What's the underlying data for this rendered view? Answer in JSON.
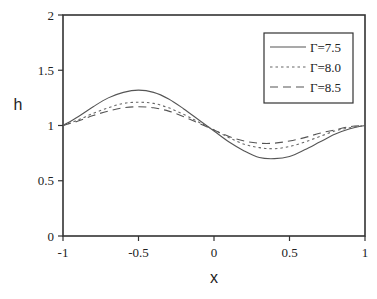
{
  "chart_data": {
    "type": "line",
    "title": "",
    "xlabel": "x",
    "ylabel": "h",
    "xlim": [
      -1,
      1
    ],
    "ylim": [
      0,
      2
    ],
    "xticks": [
      -1,
      -0.5,
      0,
      0.5,
      1
    ],
    "xtick_labels": [
      "-1",
      "-0.5",
      "0",
      "0.5",
      "1"
    ],
    "yticks": [
      0,
      0.5,
      1,
      1.5,
      2
    ],
    "ytick_labels": [
      "0",
      "0.5",
      "1",
      "1.5",
      "2"
    ],
    "grid": false,
    "legend_position": "top-right",
    "series": [
      {
        "name": "Γ=7.5",
        "style": "solid",
        "x": [
          -1,
          -0.9,
          -0.8,
          -0.7,
          -0.6,
          -0.5,
          -0.4,
          -0.3,
          -0.2,
          -0.1,
          0,
          0.1,
          0.2,
          0.3,
          0.4,
          0.5,
          0.6,
          0.7,
          0.8,
          0.9,
          1
        ],
        "y": [
          1.0,
          1.08,
          1.17,
          1.25,
          1.3,
          1.32,
          1.3,
          1.24,
          1.15,
          1.05,
          0.95,
          0.85,
          0.77,
          0.71,
          0.7,
          0.72,
          0.78,
          0.85,
          0.92,
          0.97,
          1.0
        ]
      },
      {
        "name": "Γ=8.0",
        "style": "dotted",
        "x": [
          -1,
          -0.9,
          -0.8,
          -0.7,
          -0.6,
          -0.5,
          -0.4,
          -0.3,
          -0.2,
          -0.1,
          0,
          0.1,
          0.2,
          0.3,
          0.4,
          0.5,
          0.6,
          0.7,
          0.8,
          0.9,
          1
        ],
        "y": [
          1.0,
          1.05,
          1.11,
          1.16,
          1.2,
          1.21,
          1.2,
          1.16,
          1.1,
          1.03,
          0.96,
          0.89,
          0.83,
          0.8,
          0.79,
          0.81,
          0.85,
          0.9,
          0.95,
          0.98,
          1.0
        ]
      },
      {
        "name": "Γ=8.5",
        "style": "dashed",
        "x": [
          -1,
          -0.9,
          -0.8,
          -0.7,
          -0.6,
          -0.5,
          -0.4,
          -0.3,
          -0.2,
          -0.1,
          0,
          0.1,
          0.2,
          0.3,
          0.4,
          0.5,
          0.6,
          0.7,
          0.8,
          0.9,
          1
        ],
        "y": [
          1.0,
          1.04,
          1.09,
          1.13,
          1.16,
          1.17,
          1.16,
          1.13,
          1.08,
          1.02,
          0.96,
          0.9,
          0.86,
          0.84,
          0.84,
          0.86,
          0.89,
          0.93,
          0.96,
          0.99,
          1.0
        ]
      }
    ]
  }
}
